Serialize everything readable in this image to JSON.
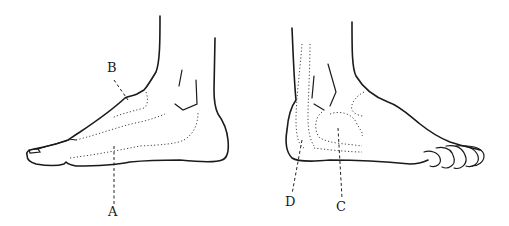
{
  "diagram": {
    "left_foot": {
      "view": "medial",
      "labels": [
        {
          "id": "B",
          "text": "B"
        },
        {
          "id": "A",
          "text": "A"
        }
      ]
    },
    "right_foot": {
      "view": "lateral",
      "labels": [
        {
          "id": "D",
          "text": "D"
        },
        {
          "id": "C",
          "text": "C"
        }
      ]
    }
  }
}
